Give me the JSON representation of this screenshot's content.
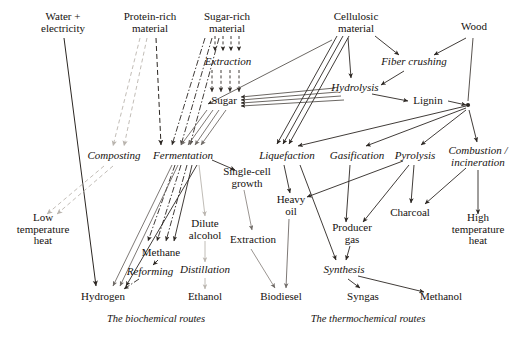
{
  "diagram": {
    "width": 526,
    "height": 338,
    "background": "#ffffff",
    "captions": [
      {
        "id": "cap-biochemical",
        "label": "The biochemical routes",
        "x": 156,
        "y": 318
      },
      {
        "id": "cap-thermochemical",
        "label": "The thermochemical routes",
        "x": 368,
        "y": 318
      }
    ],
    "colors": {
      "ink": "#16120f",
      "line_dark": "#2b2622",
      "line_mid": "#6f6a66",
      "line_pale": "#b9b4ae",
      "line_faint": "#cfcac4"
    },
    "nodes": [
      {
        "id": "water-electricity",
        "label": "Water +\nelectricity",
        "kind": "feedstock",
        "x": 63,
        "y": 22
      },
      {
        "id": "protein-rich-material",
        "label": "Protein-rich\nmaterial",
        "kind": "feedstock",
        "x": 150,
        "y": 22
      },
      {
        "id": "sugar-rich-material",
        "label": "Sugar-rich\nmaterial",
        "kind": "feedstock",
        "x": 227,
        "y": 22
      },
      {
        "id": "cellulosic-material",
        "label": "Cellulosic\nmaterial",
        "kind": "feedstock",
        "x": 356,
        "y": 22
      },
      {
        "id": "wood",
        "label": "Wood",
        "kind": "feedstock",
        "x": 474,
        "y": 27
      },
      {
        "id": "extraction-sugar",
        "label": "Extraction",
        "kind": "process",
        "x": 228,
        "y": 62
      },
      {
        "id": "sugar",
        "label": "Sugar",
        "kind": "intermediate",
        "x": 224,
        "y": 101
      },
      {
        "id": "fiber-crushing",
        "label": "Fiber crushing",
        "kind": "process",
        "x": 414,
        "y": 62
      },
      {
        "id": "hydrolysis",
        "label": "Hydrolysis",
        "kind": "process",
        "x": 355,
        "y": 88
      },
      {
        "id": "lignin",
        "label": "Lignin",
        "kind": "intermediate",
        "x": 428,
        "y": 101
      },
      {
        "id": "composting",
        "label": "Composting",
        "kind": "process",
        "x": 114,
        "y": 156
      },
      {
        "id": "fermentation",
        "label": "Fermentation",
        "kind": "process",
        "x": 183,
        "y": 156
      },
      {
        "id": "liquefaction",
        "label": "Liquefaction",
        "kind": "process",
        "x": 287,
        "y": 156
      },
      {
        "id": "gasification",
        "label": "Gasification",
        "kind": "process",
        "x": 357,
        "y": 156
      },
      {
        "id": "pyrolysis",
        "label": "Pyrolysis",
        "kind": "process",
        "x": 415,
        "y": 156
      },
      {
        "id": "combustion-incineration",
        "label": "Combustion /\nincineration",
        "kind": "process",
        "x": 478,
        "y": 156
      },
      {
        "id": "single-cell-growth",
        "label": "Single-cell\ngrowth",
        "kind": "intermediate",
        "x": 247,
        "y": 177
      },
      {
        "id": "heavy-oil",
        "label": "Heavy\noil",
        "kind": "intermediate",
        "x": 291,
        "y": 205
      },
      {
        "id": "low-temperature-heat",
        "label": "Low\ntemperature\nheat",
        "kind": "product",
        "x": 43,
        "y": 229
      },
      {
        "id": "dilute-alcohol",
        "label": "Dilute\nalcohol",
        "kind": "intermediate",
        "x": 205,
        "y": 229
      },
      {
        "id": "extraction-oil",
        "label": "Extraction",
        "kind": "process",
        "x": 253,
        "y": 240
      },
      {
        "id": "charcoal",
        "label": "Charcoal",
        "kind": "product",
        "x": 410,
        "y": 213
      },
      {
        "id": "producer-gas",
        "label": "Producer\ngas",
        "kind": "intermediate",
        "x": 352,
        "y": 233
      },
      {
        "id": "high-temperature-heat",
        "label": "High\ntemperature\nheat",
        "kind": "product",
        "x": 478,
        "y": 229
      },
      {
        "id": "methane",
        "label": "Methane",
        "kind": "product",
        "x": 161,
        "y": 253
      },
      {
        "id": "reforming",
        "label": "Reforming",
        "kind": "process",
        "x": 150,
        "y": 272
      },
      {
        "id": "distillation",
        "label": "Distillation",
        "kind": "process",
        "x": 205,
        "y": 270
      },
      {
        "id": "synthesis",
        "label": "Synthesis",
        "kind": "process",
        "x": 344,
        "y": 270
      },
      {
        "id": "hydrogen",
        "label": "Hydrogen",
        "kind": "product",
        "x": 103,
        "y": 297
      },
      {
        "id": "ethanol",
        "label": "Ethanol",
        "kind": "product",
        "x": 205,
        "y": 297
      },
      {
        "id": "biodiesel",
        "label": "Biodiesel",
        "kind": "product",
        "x": 281,
        "y": 297
      },
      {
        "id": "syngas",
        "label": "Syngas",
        "kind": "product",
        "x": 363,
        "y": 297
      },
      {
        "id": "methanol",
        "label": "Methanol",
        "kind": "product",
        "x": 441,
        "y": 297
      }
    ],
    "edges": [
      {
        "from": "water-electricity",
        "to": "hydrogen",
        "style": "solid-dark"
      },
      {
        "from": "protein-rich-material",
        "to": "composting",
        "style": "dashed-pale"
      },
      {
        "from": "protein-rich-material",
        "to": "fermentation",
        "style": "dashed-dark"
      },
      {
        "from": "sugar-rich-material",
        "to": "extraction-sugar",
        "style": "dashed-dark"
      },
      {
        "from": "extraction-sugar",
        "to": "sugar",
        "style": "dashed-dark"
      },
      {
        "from": "sugar-rich-material",
        "to": "fermentation",
        "style": "dashed-dark"
      },
      {
        "from": "sugar",
        "to": "fermentation",
        "style": "solid-mid"
      },
      {
        "from": "cellulosic-material",
        "to": "hydrolysis",
        "style": "solid-dark"
      },
      {
        "from": "cellulosic-material",
        "to": "fiber-crushing",
        "style": "solid-dark"
      },
      {
        "from": "cellulosic-material",
        "to": "liquefaction",
        "style": "solid-dark"
      },
      {
        "from": "wood",
        "to": "fiber-crushing",
        "style": "solid-dark"
      },
      {
        "from": "wood",
        "to": "thermo-hub",
        "style": "solid-dark"
      },
      {
        "from": "fiber-crushing",
        "to": "hydrolysis",
        "style": "solid-dark"
      },
      {
        "from": "hydrolysis",
        "to": "sugar",
        "style": "solid-dark"
      },
      {
        "from": "hydrolysis",
        "to": "lignin",
        "style": "solid-dark"
      },
      {
        "from": "lignin",
        "to": "thermo-hub",
        "style": "solid-dark"
      },
      {
        "from": "thermo-hub",
        "to": "liquefaction",
        "style": "solid-dark"
      },
      {
        "from": "thermo-hub",
        "to": "gasification",
        "style": "solid-dark"
      },
      {
        "from": "thermo-hub",
        "to": "pyrolysis",
        "style": "solid-dark"
      },
      {
        "from": "thermo-hub",
        "to": "combustion-incineration",
        "style": "solid-dark"
      },
      {
        "from": "composting",
        "to": "low-temperature-heat",
        "style": "dashed-pale"
      },
      {
        "from": "fermentation",
        "to": "methane",
        "style": "dash-dot-dark"
      },
      {
        "from": "fermentation",
        "to": "hydrogen",
        "style": "solid-mid"
      },
      {
        "from": "fermentation",
        "to": "single-cell-growth",
        "style": "solid-dark"
      },
      {
        "from": "fermentation",
        "to": "dilute-alcohol",
        "style": "solid-pale"
      },
      {
        "from": "single-cell-growth",
        "to": "extraction-oil",
        "style": "solid-mid"
      },
      {
        "from": "dilute-alcohol",
        "to": "distillation",
        "style": "solid-pale"
      },
      {
        "from": "distillation",
        "to": "ethanol",
        "style": "solid-pale"
      },
      {
        "from": "extraction-oil",
        "to": "biodiesel",
        "style": "solid-mid"
      },
      {
        "from": "heavy-oil",
        "to": "biodiesel",
        "style": "solid-mid"
      },
      {
        "from": "methane",
        "to": "reforming",
        "style": "dash-dot-dark"
      },
      {
        "from": "reforming",
        "to": "hydrogen",
        "style": "dash-dot-dark"
      },
      {
        "from": "liquefaction",
        "to": "heavy-oil",
        "style": "solid-dark"
      },
      {
        "from": "liquefaction",
        "to": "synthesis",
        "style": "solid-dark"
      },
      {
        "from": "gasification",
        "to": "producer-gas",
        "style": "solid-dark"
      },
      {
        "from": "pyrolysis",
        "to": "heavy-oil",
        "style": "solid-dark"
      },
      {
        "from": "pyrolysis",
        "to": "producer-gas",
        "style": "solid-dark"
      },
      {
        "from": "pyrolysis",
        "to": "charcoal",
        "style": "solid-dark"
      },
      {
        "from": "combustion-incineration",
        "to": "high-temperature-heat",
        "style": "solid-dark"
      },
      {
        "from": "producer-gas",
        "to": "synthesis",
        "style": "solid-dark"
      },
      {
        "from": "synthesis",
        "to": "syngas",
        "style": "solid-dark"
      },
      {
        "from": "synthesis",
        "to": "methanol",
        "style": "solid-dark"
      }
    ]
  }
}
